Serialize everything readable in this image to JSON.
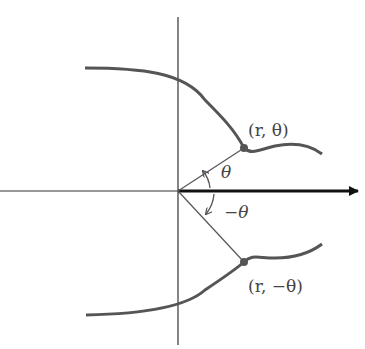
{
  "diagram": {
    "labels": {
      "point_upper": "(r, θ)",
      "point_lower": "(r, −θ)",
      "angle_upper": "θ",
      "angle_lower": "−θ"
    },
    "colors": {
      "curve": "#555555",
      "axis": "#222222",
      "ray": "#555555",
      "point": "#555555",
      "label": "#444444"
    },
    "origin": [
      178,
      191
    ],
    "upper_point": [
      244,
      148
    ],
    "lower_point": [
      244,
      262
    ]
  }
}
